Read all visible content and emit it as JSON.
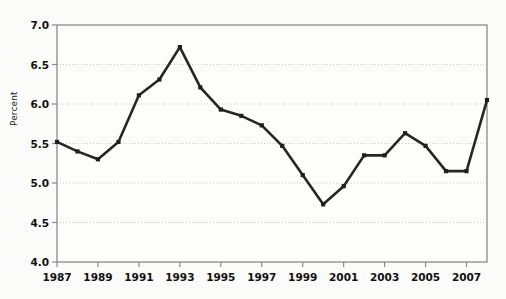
{
  "chart_data": {
    "type": "line",
    "title": "",
    "subtitle": "",
    "xlabel": "",
    "ylabel": "Percent",
    "ylim": [
      4.0,
      7.0
    ],
    "xlim": [
      1987,
      2008
    ],
    "ytick_labels": [
      "7.0",
      "6.5",
      "6.0",
      "5.5",
      "5.0",
      "4.5",
      "4.0"
    ],
    "ytick_values": [
      7.0,
      6.5,
      6.0,
      5.5,
      5.0,
      4.5,
      4.0
    ],
    "xtick_labels": [
      "1987",
      "1989",
      "1991",
      "1993",
      "1995",
      "1997",
      "1999",
      "2001",
      "2003",
      "2005",
      "2007"
    ],
    "xtick_values": [
      1987,
      1989,
      1991,
      1993,
      1995,
      1997,
      1999,
      2001,
      2003,
      2005,
      2007
    ],
    "grid": "horizontal-dotted",
    "legend": "none",
    "x": [
      1987,
      1988,
      1989,
      1990,
      1991,
      1992,
      1993,
      1994,
      1995,
      1996,
      1997,
      1998,
      1999,
      2000,
      2001,
      2002,
      2003,
      2004,
      2005,
      2006,
      2007,
      2008
    ],
    "values": [
      5.52,
      5.4,
      5.3,
      5.52,
      6.11,
      6.31,
      6.72,
      6.21,
      5.93,
      5.85,
      5.73,
      5.47,
      5.1,
      4.73,
      4.96,
      5.35,
      5.35,
      5.63,
      5.47,
      5.15,
      5.15,
      6.05
    ],
    "series": [
      {
        "name": "Percent",
        "values": [
          5.52,
          5.4,
          5.3,
          5.52,
          6.11,
          6.31,
          6.72,
          6.21,
          5.93,
          5.85,
          5.73,
          5.47,
          5.1,
          4.73,
          4.96,
          5.35,
          5.35,
          5.63,
          5.47,
          5.15,
          5.15,
          6.05
        ]
      }
    ],
    "marker": "square",
    "colors": {
      "line": "#262626",
      "marker": "#1f1f1f",
      "grid": "#c8c8c8",
      "frame": "#8a8a8a",
      "background": "#fbfbf9",
      "plot_background": "#fdfdfb",
      "text": "#111111"
    }
  }
}
